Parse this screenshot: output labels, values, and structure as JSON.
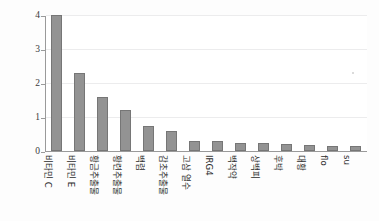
{
  "chart_data": {
    "type": "bar",
    "title": "",
    "xlabel": "",
    "ylabel": "Absorbance at 700nm",
    "ylim": [
      0,
      4
    ],
    "yticks": [
      0,
      1,
      2,
      3,
      4
    ],
    "grid": true,
    "legend": "none",
    "bar_color": "#939393",
    "bar_edge_color": "#767676",
    "categories": [
      "비타민 C",
      "비타민 E",
      "황금추출물",
      "황련추출물",
      "백렴",
      "감초추출물",
      "고삼 열수",
      "IRG4",
      "백작약",
      "상백피",
      "후박",
      "대황",
      "flo",
      "su"
    ],
    "values": [
      4.0,
      2.3,
      1.58,
      1.2,
      0.75,
      0.6,
      0.3,
      0.28,
      0.25,
      0.23,
      0.2,
      0.19,
      0.15,
      0.15
    ]
  },
  "axes": {
    "y_axis_title": "Absorbance at 700nm"
  }
}
